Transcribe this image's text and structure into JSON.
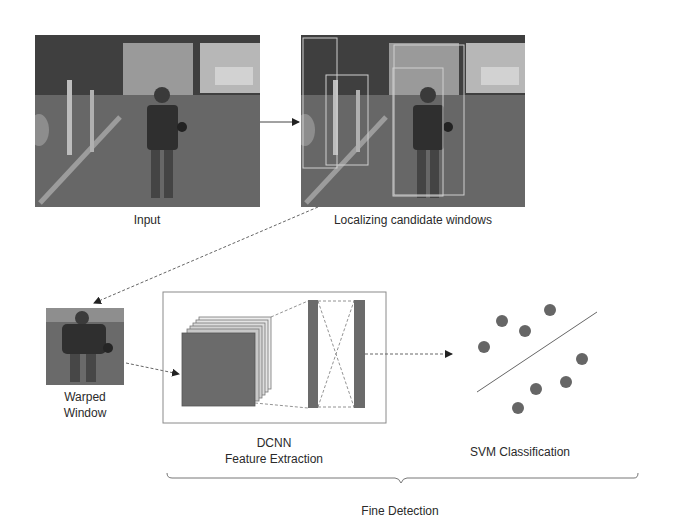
{
  "figure": {
    "stages": {
      "input": {
        "label": "Input"
      },
      "localization": {
        "label": "Localizing candidate windows"
      },
      "warped": {
        "label_line1": "Warped",
        "label_line2": "Window"
      },
      "dcnn": {
        "label_line1": "DCNN",
        "label_line2": "Feature Extraction"
      },
      "svm": {
        "label": "SVM Classification"
      },
      "group": {
        "label": "Fine Detection"
      }
    },
    "colors": {
      "photo_dark": "#4a4a4a",
      "photo_mid": "#6e6e6e",
      "photo_sky": "#bdbdbd",
      "block_fill": "#6b6b6b",
      "dot_fill": "#666666",
      "line": "#555555",
      "box_border": "#8a8a8a"
    },
    "svm_points": [
      {
        "x": 502,
        "y": 321
      },
      {
        "x": 525,
        "y": 311
      },
      {
        "x": 550,
        "y": 330
      },
      {
        "x": 485,
        "y": 347
      },
      {
        "x": 583,
        "y": 359
      },
      {
        "x": 566,
        "y": 382
      },
      {
        "x": 536,
        "y": 389
      },
      {
        "x": 518,
        "y": 408
      }
    ],
    "candidate_windows": [
      {
        "x": 303,
        "y": 38,
        "w": 34,
        "h": 130
      },
      {
        "x": 326,
        "y": 75,
        "w": 42,
        "h": 90
      },
      {
        "x": 394,
        "y": 45,
        "w": 70,
        "h": 150
      },
      {
        "x": 393,
        "y": 68,
        "w": 50,
        "h": 128
      }
    ]
  }
}
